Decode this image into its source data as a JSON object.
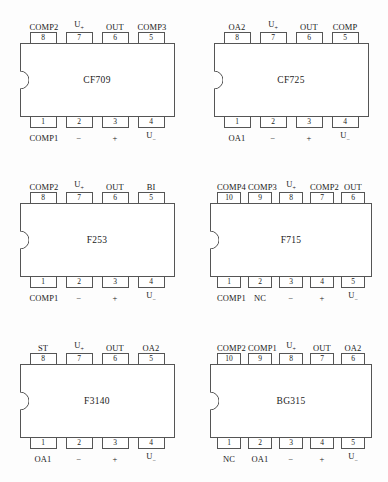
{
  "figure": {
    "kind": "ic-pinout-diagram",
    "package_count": 6,
    "ink_color": "#555555",
    "background_color": "#fdfdfd"
  },
  "chips": [
    {
      "name": "CF709",
      "pin_count": 8,
      "top_pins": [
        {
          "number": "8",
          "label": "COMP2"
        },
        {
          "number": "7",
          "label": "U",
          "sub": "+"
        },
        {
          "number": "6",
          "label": "OUT"
        },
        {
          "number": "5",
          "label": "COMP3"
        }
      ],
      "bottom_pins": [
        {
          "number": "1",
          "label": "COMP1"
        },
        {
          "number": "2",
          "label": "−"
        },
        {
          "number": "3",
          "label": "+"
        },
        {
          "number": "4",
          "label": "U",
          "sub": "−"
        }
      ]
    },
    {
      "name": "CF725",
      "pin_count": 8,
      "top_pins": [
        {
          "number": "8",
          "label": "OA2"
        },
        {
          "number": "7",
          "label": "U",
          "sub": "+"
        },
        {
          "number": "6",
          "label": "OUT"
        },
        {
          "number": "5",
          "label": "COMP"
        }
      ],
      "bottom_pins": [
        {
          "number": "1",
          "label": "OA1"
        },
        {
          "number": "2",
          "label": "−"
        },
        {
          "number": "3",
          "label": "+"
        },
        {
          "number": "4",
          "label": "U",
          "sub": "−"
        }
      ]
    },
    {
      "name": "F253",
      "pin_count": 8,
      "top_pins": [
        {
          "number": "8",
          "label": "COMP2"
        },
        {
          "number": "7",
          "label": "U",
          "sub": "+"
        },
        {
          "number": "6",
          "label": "OUT"
        },
        {
          "number": "5",
          "label": "BI"
        }
      ],
      "bottom_pins": [
        {
          "number": "1",
          "label": "COMP1"
        },
        {
          "number": "2",
          "label": "−"
        },
        {
          "number": "3",
          "label": "+"
        },
        {
          "number": "4",
          "label": "U",
          "sub": "−"
        }
      ]
    },
    {
      "name": "F715",
      "pin_count": 10,
      "top_pins": [
        {
          "number": "10",
          "label": "COMP4"
        },
        {
          "number": "9",
          "label": "COMP3"
        },
        {
          "number": "8",
          "label": "U",
          "sub": "+"
        },
        {
          "number": "7",
          "label": "COMP2"
        },
        {
          "number": "6",
          "label": "OUT"
        }
      ],
      "bottom_pins": [
        {
          "number": "1",
          "label": "COMP1"
        },
        {
          "number": "2",
          "label": "NC"
        },
        {
          "number": "3",
          "label": "−"
        },
        {
          "number": "4",
          "label": "+"
        },
        {
          "number": "5",
          "label": "U",
          "sub": "−"
        }
      ]
    },
    {
      "name": "F3140",
      "pin_count": 8,
      "top_pins": [
        {
          "number": "8",
          "label": "ST"
        },
        {
          "number": "7",
          "label": "U",
          "sub": "+"
        },
        {
          "number": "6",
          "label": "OUT"
        },
        {
          "number": "5",
          "label": "OA2"
        }
      ],
      "bottom_pins": [
        {
          "number": "1",
          "label": "OA1"
        },
        {
          "number": "2",
          "label": "−"
        },
        {
          "number": "3",
          "label": "+"
        },
        {
          "number": "4",
          "label": "U",
          "sub": "−"
        }
      ]
    },
    {
      "name": "BG315",
      "pin_count": 10,
      "top_pins": [
        {
          "number": "10",
          "label": "COMP2"
        },
        {
          "number": "9",
          "label": "COMP1"
        },
        {
          "number": "8",
          "label": "U",
          "sub": "+"
        },
        {
          "number": "7",
          "label": "OUT"
        },
        {
          "number": "6",
          "label": "OA2"
        }
      ],
      "bottom_pins": [
        {
          "number": "1",
          "label": "NC"
        },
        {
          "number": "2",
          "label": "OA1"
        },
        {
          "number": "3",
          "label": "−"
        },
        {
          "number": "4",
          "label": "+"
        },
        {
          "number": "5",
          "label": "U",
          "sub": "−"
        }
      ]
    }
  ]
}
